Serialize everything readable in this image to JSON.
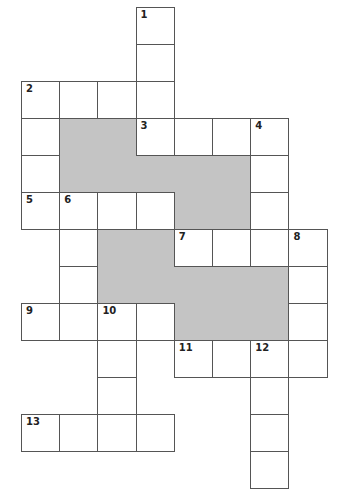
{
  "puzzle": {
    "type": "crossword",
    "grid": {
      "cols": 8,
      "rows": 13,
      "origin_x": 21,
      "origin_y": 7,
      "cell_w": 38.2,
      "cell_h": 37.0
    },
    "colors": {
      "shade": "#c4c4c4",
      "line": "#555555",
      "cell": "#ffffff"
    },
    "shaded_regions": [
      {
        "c": 1,
        "r": 3,
        "w": 2,
        "h": 2
      },
      {
        "c": 3,
        "r": 4,
        "w": 1,
        "h": 1
      },
      {
        "c": 4,
        "r": 4,
        "w": 2,
        "h": 2
      },
      {
        "c": 2,
        "r": 6,
        "w": 2,
        "h": 2
      },
      {
        "c": 4,
        "r": 7,
        "w": 3,
        "h": 2
      }
    ],
    "entries": [
      {
        "number": "1",
        "direction": "down",
        "c": 3,
        "r": 0,
        "length": 4
      },
      {
        "number": "2",
        "direction": "across",
        "c": 0,
        "r": 2,
        "length": 4
      },
      {
        "number": "2",
        "direction": "down",
        "c": 0,
        "r": 2,
        "length": 4
      },
      {
        "number": "3",
        "direction": "across",
        "c": 3,
        "r": 3,
        "length": 4
      },
      {
        "number": "4",
        "direction": "down",
        "c": 6,
        "r": 3,
        "length": 4
      },
      {
        "number": "5",
        "direction": "across",
        "c": 0,
        "r": 5,
        "length": 4
      },
      {
        "number": "6",
        "direction": "down",
        "c": 1,
        "r": 5,
        "length": 4
      },
      {
        "number": "7",
        "direction": "across",
        "c": 4,
        "r": 6,
        "length": 4
      },
      {
        "number": "8",
        "direction": "down",
        "c": 7,
        "r": 6,
        "length": 4
      },
      {
        "number": "9",
        "direction": "across",
        "c": 0,
        "r": 8,
        "length": 4
      },
      {
        "number": "10",
        "direction": "down",
        "c": 2,
        "r": 8,
        "length": 4
      },
      {
        "number": "11",
        "direction": "across",
        "c": 4,
        "r": 9,
        "length": 4
      },
      {
        "number": "12",
        "direction": "down",
        "c": 6,
        "r": 9,
        "length": 4
      },
      {
        "number": "13",
        "direction": "across",
        "c": 0,
        "r": 11,
        "length": 4
      }
    ]
  }
}
